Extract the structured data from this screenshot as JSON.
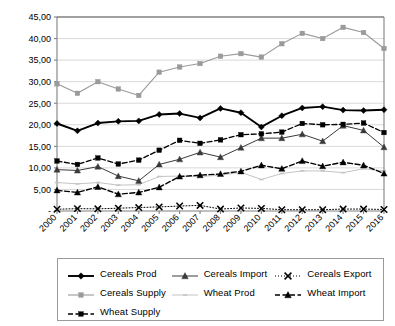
{
  "chart_data": {
    "type": "line",
    "title": "",
    "xlabel": "",
    "ylabel": "",
    "ylim": [
      0,
      45
    ],
    "yticks": [
      0,
      5,
      10,
      15,
      20,
      25,
      30,
      35,
      40,
      45
    ],
    "ytick_labels": [
      "-",
      "5,00",
      "10,00",
      "15,00",
      "20,00",
      "25,00",
      "30,00",
      "35,00",
      "40,00",
      "45,00"
    ],
    "grid": true,
    "legend_position": "bottom",
    "decimal_separator": ",",
    "categories": [
      "2000",
      "2001",
      "2002",
      "2003",
      "2004",
      "2005",
      "2006",
      "2007",
      "2008",
      "2009",
      "2010",
      "2011",
      "2012",
      "2013",
      "2014",
      "2015",
      "2016"
    ],
    "series": [
      {
        "name": "Cereals Prod",
        "color": "#000000",
        "marker": "diamond",
        "line": "solid",
        "width": 1.9,
        "values": [
          20.3,
          18.6,
          20.4,
          20.8,
          20.9,
          22.4,
          22.6,
          21.6,
          23.8,
          22.8,
          19.5,
          22.1,
          23.9,
          24.2,
          23.4,
          23.3,
          23.5
        ]
      },
      {
        "name": "Cereals Import",
        "color": "#3a3a3a",
        "marker": "triangle",
        "line": "solid",
        "width": 1.0,
        "values": [
          9.6,
          9.4,
          10.3,
          8.1,
          7.0,
          10.8,
          12.0,
          13.6,
          12.5,
          14.7,
          16.9,
          16.9,
          17.8,
          16.2,
          19.8,
          18.7,
          14.8
        ]
      },
      {
        "name": "Cereals Export",
        "color": "#000000",
        "marker": "x",
        "line": "dotted",
        "width": 1.0,
        "values": [
          0.4,
          0.55,
          0.5,
          0.65,
          0.8,
          0.95,
          1.15,
          1.3,
          0.45,
          0.7,
          0.6,
          0.3,
          0.3,
          0.3,
          0.45,
          0.45,
          0.35
        ]
      },
      {
        "name": "Cereals Supply",
        "color": "#9a9a9a",
        "marker": "square",
        "line": "solid",
        "width": 1.1,
        "values": [
          29.5,
          27.3,
          30.0,
          28.3,
          26.8,
          32.2,
          33.4,
          34.2,
          35.9,
          36.5,
          35.7,
          38.8,
          41.2,
          40.0,
          42.6,
          41.4,
          37.7
        ]
      },
      {
        "name": "Wheat Prod",
        "color": "#c4c4c4",
        "marker": "dash",
        "line": "solid",
        "width": 1.0,
        "values": [
          6.6,
          6.3,
          6.6,
          6.0,
          6.1,
          8.0,
          8.1,
          8.0,
          8.3,
          9.0,
          7.3,
          8.7,
          9.3,
          9.3,
          8.9,
          9.8,
          9.3
        ]
      },
      {
        "name": "Wheat Import",
        "color": "#000000",
        "marker": "triangle",
        "line": "dashed",
        "width": 1.4,
        "values": [
          4.8,
          4.3,
          5.6,
          3.9,
          4.3,
          5.5,
          8.0,
          8.3,
          8.6,
          9.2,
          10.6,
          9.8,
          11.6,
          10.4,
          11.3,
          10.6,
          8.7
        ]
      },
      {
        "name": "Wheat Supply",
        "color": "#000000",
        "marker": "square",
        "line": "dashed",
        "width": 1.3,
        "values": [
          11.6,
          10.8,
          12.3,
          10.9,
          11.8,
          14.1,
          16.4,
          15.7,
          16.5,
          17.7,
          17.9,
          18.3,
          20.3,
          20.0,
          20.1,
          20.4,
          18.2
        ]
      }
    ]
  },
  "legend": {
    "items": [
      {
        "label": "Cereals Prod"
      },
      {
        "label": "Cereals Import"
      },
      {
        "label": "Cereals Export"
      },
      {
        "label": "Cereals Supply"
      },
      {
        "label": "Wheat Prod"
      },
      {
        "label": "Wheat Import"
      },
      {
        "label": "Wheat Supply"
      }
    ]
  }
}
